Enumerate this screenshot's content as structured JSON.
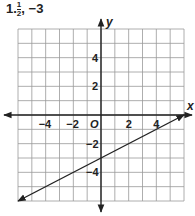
{
  "problem": {
    "number": "1.",
    "slope_num": "1",
    "slope_den": "2",
    "sep": ",",
    "intercept": "−3"
  },
  "axes": {
    "x_label": "x",
    "y_label": "y",
    "origin_label": "O"
  },
  "ticks": {
    "x": [
      {
        "v": -4,
        "t": "−4"
      },
      {
        "v": -2,
        "t": "−2"
      },
      {
        "v": 2,
        "t": "2"
      },
      {
        "v": 4,
        "t": "4"
      }
    ],
    "y": [
      {
        "v": 4,
        "t": "4"
      },
      {
        "v": 2,
        "t": "2"
      },
      {
        "v": -2,
        "t": "−2"
      },
      {
        "v": -4,
        "t": "−4"
      }
    ]
  },
  "chart_data": {
    "type": "line",
    "title": "1. 1/2, −3",
    "xlabel": "x",
    "ylabel": "y",
    "xlim": [
      -6,
      6
    ],
    "ylim": [
      -6,
      6
    ],
    "grid": true,
    "series": [
      {
        "name": "y = (1/2)x − 3",
        "slope": 0.5,
        "intercept": -3,
        "x": [
          -6,
          6
        ],
        "y": [
          -6,
          0
        ]
      }
    ],
    "x_ticks": [
      -4,
      -2,
      2,
      4
    ],
    "y_ticks": [
      -4,
      -2,
      2,
      4
    ],
    "legend": []
  }
}
